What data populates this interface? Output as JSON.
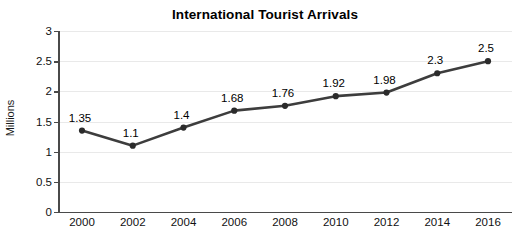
{
  "chart_data": {
    "type": "line",
    "title": "International Tourist Arrivals",
    "xlabel": "",
    "ylabel": "Millions",
    "categories": [
      "2000",
      "2002",
      "2004",
      "2006",
      "2008",
      "2010",
      "2012",
      "2014",
      "2016"
    ],
    "values": [
      1.35,
      1.1,
      1.4,
      1.68,
      1.76,
      1.92,
      1.98,
      2.3,
      2.5
    ],
    "point_labels": [
      "1.35",
      "1.1",
      "1.4",
      "1.68",
      "1.76",
      "1.92",
      "1.98",
      "2.3",
      "2.5"
    ],
    "ylim": [
      0,
      3
    ],
    "xlim": [
      2000,
      2016
    ],
    "yticks": [
      0,
      0.5,
      1,
      1.5,
      2,
      2.5,
      3
    ],
    "ytick_labels": [
      "0",
      "0.5",
      "1",
      "1.5",
      "2",
      "2.5",
      "3"
    ],
    "grid": true,
    "grid_axis": "y",
    "legend": false,
    "legend_position": "none",
    "series": [
      {
        "name": "International Tourist Arrivals",
        "values": [
          1.35,
          1.1,
          1.4,
          1.68,
          1.76,
          1.92,
          1.98,
          2.3,
          2.5
        ]
      }
    ],
    "colors": {
      "line": "#3d3d3d",
      "marker": "#2b2b2b",
      "grid": "#e9e9e9",
      "axis": "#4a4a4a",
      "text": "#111111",
      "background": "#ffffff"
    }
  }
}
